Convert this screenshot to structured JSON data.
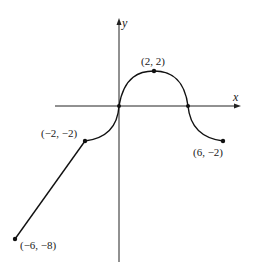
{
  "figure": {
    "type": "function-graph",
    "axes": {
      "x_label": "x",
      "y_label": "y"
    },
    "points": [
      {
        "x": -6,
        "y": -8,
        "label": "(−6, −8)"
      },
      {
        "x": -2,
        "y": -2,
        "label": "(−2, −2)"
      },
      {
        "x": 0,
        "y": 0,
        "label": ""
      },
      {
        "x": 2,
        "y": 2,
        "label": "(2, 2)"
      },
      {
        "x": 4,
        "y": 0,
        "label": ""
      },
      {
        "x": 6,
        "y": -2,
        "label": "(6, −2)"
      }
    ],
    "segments": [
      {
        "from": [
          -6,
          -8
        ],
        "to": [
          -2,
          -2
        ],
        "shape": "line"
      },
      {
        "from": [
          -2,
          -2
        ],
        "to": [
          0,
          0
        ],
        "shape": "quarter-circle arc (concave down)"
      },
      {
        "from": [
          0,
          0
        ],
        "to": [
          4,
          0
        ],
        "shape": "arch peaking at (2, 2)"
      },
      {
        "from": [
          4,
          0
        ],
        "to": [
          6,
          -2
        ],
        "shape": "quarter-circle arc (concave up)"
      }
    ]
  }
}
